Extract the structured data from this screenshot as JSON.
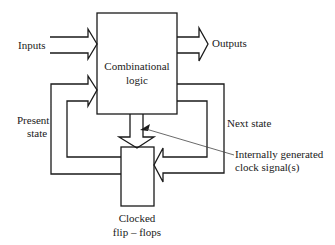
{
  "diagram": {
    "type": "sequential-circuit-block-diagram",
    "blocks": {
      "combinational_logic": {
        "line1": "Combinational",
        "line2": "logic"
      },
      "flip_flops": {
        "line1": "Clocked",
        "line2": "flip – flops"
      }
    },
    "labels": {
      "inputs": "Inputs",
      "outputs": "Outputs",
      "present_state_line1": "Present",
      "present_state_line2": "state",
      "next_state": "Next state",
      "clock_line1": "Internally generated",
      "clock_line2": "clock signal(s)"
    },
    "connections": [
      {
        "from": "Inputs",
        "to": "Combinational logic"
      },
      {
        "from": "Combinational logic",
        "to": "Outputs"
      },
      {
        "from": "Combinational logic",
        "to": "Clocked flip-flops",
        "label": "Next state"
      },
      {
        "from": "Clocked flip-flops",
        "to": "Combinational logic",
        "label": "Present state"
      },
      {
        "from": "Combinational logic",
        "to": "Clocked flip-flops",
        "label": "Internally generated clock signal(s)"
      }
    ]
  }
}
